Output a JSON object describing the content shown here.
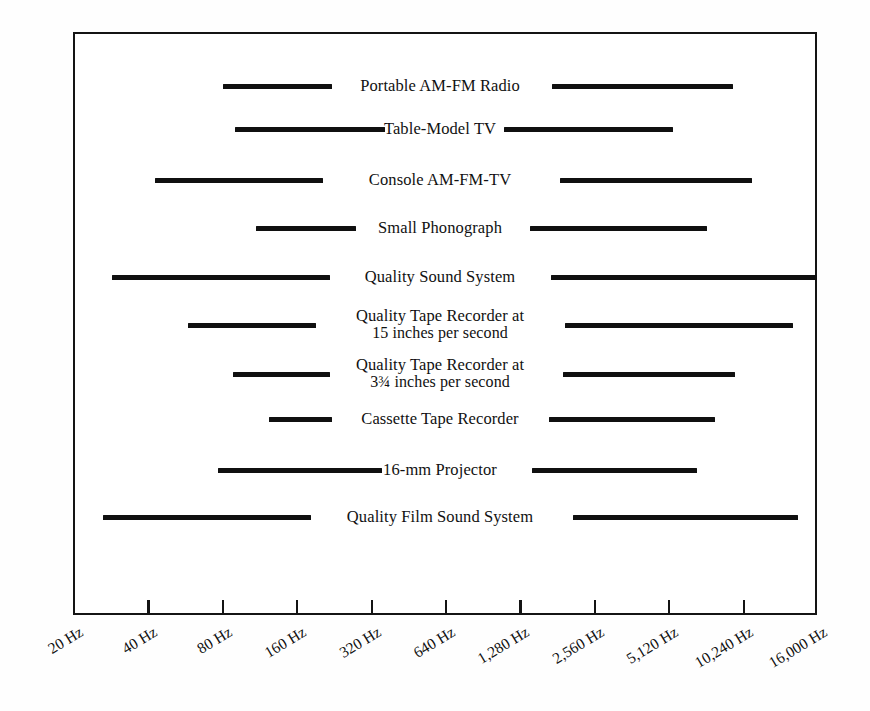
{
  "chart_data": {
    "type": "bar",
    "title": "",
    "subtitle": "",
    "xlabel": "",
    "ylabel": "",
    "orientation": "horizontal",
    "scale": "log2",
    "grid": false,
    "legend": null,
    "xlim": [
      20,
      16000
    ],
    "xticks": [
      20,
      40,
      80,
      160,
      320,
      640,
      1280,
      2560,
      5120,
      10240,
      16000
    ],
    "xtick_labels": [
      "20 Hz",
      "40 Hz",
      "80 Hz",
      "160 Hz",
      "320 Hz",
      "640 Hz",
      "1,280 Hz",
      "2,560 Hz",
      "5,120 Hz",
      "10,240 Hz",
      "16,000 Hz"
    ],
    "categories": [
      "Portable AM-FM Radio",
      "Table-Model TV",
      "Console AM-FM-TV",
      "Small Phonograph",
      "Quality Sound System",
      "Quality Tape Recorder at 15 inches per second",
      "Quality Tape Recorder at 3¾ inches per second",
      "Cassette Tape Recorder",
      "16-mm Projector",
      "Quality Film Sound System"
    ],
    "ranges_hz": [
      [
        160,
        8500
      ],
      [
        190,
        4300
      ],
      [
        80,
        11000
      ],
      [
        250,
        3400
      ],
      [
        40,
        16000
      ],
      [
        110,
        14000
      ],
      [
        180,
        6500
      ],
      [
        290,
        5300
      ],
      [
        150,
        4000
      ],
      [
        33,
        14500
      ]
    ],
    "bars": [
      {
        "label_line1": "Portable AM-FM Radio",
        "label_line2": "",
        "low_hz": 160,
        "high_hz": 8500,
        "row_y": 86,
        "left_start_px": 223,
        "left_end_px": 332,
        "label_center_px": 440,
        "right_start_px": 552,
        "right_end_px": 733
      },
      {
        "label_line1": "Table-Model TV",
        "label_line2": "",
        "low_hz": 190,
        "high_hz": 4300,
        "row_y": 129,
        "left_start_px": 235,
        "left_end_px": 385,
        "label_center_px": 440,
        "right_start_px": 504,
        "right_end_px": 673
      },
      {
        "label_line1": "Console AM-FM-TV",
        "label_line2": "",
        "low_hz": 80,
        "high_hz": 11000,
        "row_y": 180,
        "left_start_px": 155,
        "left_end_px": 323,
        "label_center_px": 440,
        "right_start_px": 560,
        "right_end_px": 752
      },
      {
        "label_line1": "Small Phonograph",
        "label_line2": "",
        "low_hz": 250,
        "high_hz": 3400,
        "row_y": 228,
        "left_start_px": 256,
        "left_end_px": 356,
        "label_center_px": 440,
        "right_start_px": 530,
        "right_end_px": 707
      },
      {
        "label_line1": "Quality Sound System",
        "label_line2": "",
        "low_hz": 40,
        "high_hz": 16000,
        "row_y": 277,
        "left_start_px": 112,
        "left_end_px": 330,
        "label_center_px": 440,
        "right_start_px": 551,
        "right_end_px": 817
      },
      {
        "label_line1": "Quality Tape Recorder at",
        "label_line2": "15 inches per second",
        "low_hz": 110,
        "high_hz": 14000,
        "row_y": 325,
        "left_start_px": 188,
        "left_end_px": 316,
        "label_center_px": 440,
        "right_start_px": 565,
        "right_end_px": 793
      },
      {
        "label_line1": "Quality Tape Recorder at",
        "label_line2": "3¾ inches per second",
        "low_hz": 180,
        "high_hz": 6500,
        "row_y": 374,
        "left_start_px": 233,
        "left_end_px": 330,
        "label_center_px": 440,
        "right_start_px": 563,
        "right_end_px": 735
      },
      {
        "label_line1": "Cassette Tape Recorder",
        "label_line2": "",
        "low_hz": 290,
        "high_hz": 5300,
        "row_y": 419,
        "left_start_px": 269,
        "left_end_px": 332,
        "label_center_px": 440,
        "right_start_px": 549,
        "right_end_px": 715
      },
      {
        "label_line1": "16-mm Projector",
        "label_line2": "",
        "low_hz": 150,
        "high_hz": 4000,
        "row_y": 470,
        "left_start_px": 218,
        "left_end_px": 382,
        "label_center_px": 440,
        "right_start_px": 532,
        "right_end_px": 697
      },
      {
        "label_line1": "Quality Film Sound System",
        "label_line2": "",
        "low_hz": 33,
        "high_hz": 14500,
        "row_y": 517,
        "left_start_px": 103,
        "left_end_px": 311,
        "label_center_px": 440,
        "right_start_px": 573,
        "right_end_px": 798
      }
    ],
    "tick_positions_px": [
      73,
      122,
      173,
      223,
      275,
      326,
      378,
      430,
      478,
      532,
      598
    ]
  }
}
